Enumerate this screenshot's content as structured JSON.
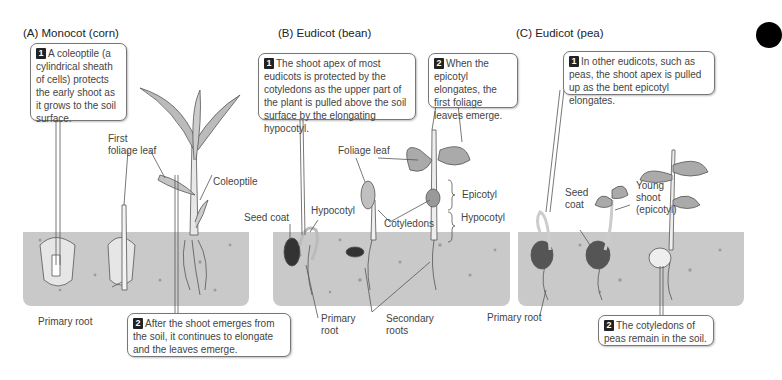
{
  "panels": [
    {
      "id": "A",
      "title": "(A)  Monocot (corn)",
      "callouts": [
        {
          "number": "1",
          "text": "A coleoptile (a cylindrical sheath of cells) protects the early shoot as it grows to the soil surface."
        },
        {
          "number": "2",
          "text": "After the shoot emerges from the soil, it continues to elongate and the leaves emerge."
        }
      ],
      "labels": {
        "first_foliage_leaf": "First\nfoliage leaf",
        "coleoptile": "Coleoptile",
        "primary_root": "Primary root"
      }
    },
    {
      "id": "B",
      "title": "(B)  Eudicot (bean)",
      "callouts": [
        {
          "number": "1",
          "text": "The shoot apex of most eudicots is protected by the cotyledons as the upper part of the plant is pulled above the soil surface by the elongating hypocotyl."
        },
        {
          "number": "2",
          "text": "When the epicotyl elongates, the first foliage leaves emerge."
        }
      ],
      "labels": {
        "foliage_leaf": "Foliage leaf",
        "seed_coat": "Seed coat",
        "hypocotyl_left": "Hypocotyl",
        "cotyledons": "Cotyledons",
        "epicotyl": "Epicotyl",
        "hypocotyl_right": "Hypocotyl",
        "primary_root": "Primary\nroot",
        "secondary_roots": "Secondary\nroots"
      }
    },
    {
      "id": "C",
      "title": "(C)  Eudicot (pea)",
      "callouts": [
        {
          "number": "1",
          "text": "In other eudicots, such as peas, the shoot apex is pulled up as the bent epicotyl elongates."
        },
        {
          "number": "2",
          "text": "The cotyledons of peas remain in the soil."
        }
      ],
      "labels": {
        "seed_coat": "Seed\ncoat",
        "young_shoot": "Young\nshoot\n(epicotyl)",
        "primary_root": "Primary root"
      }
    }
  ],
  "colors": {
    "soil": "#c9c9c9",
    "badge": "#222222",
    "callout_border": "#777777",
    "text": "#444444"
  }
}
